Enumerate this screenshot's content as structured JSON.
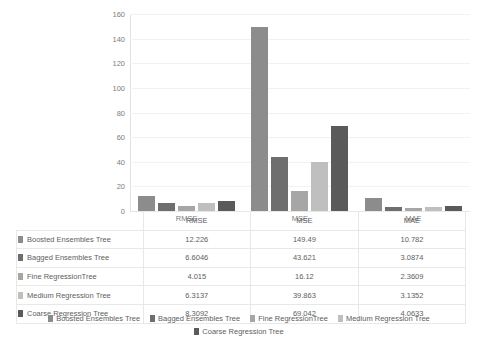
{
  "chart_data": {
    "type": "bar",
    "title": "",
    "xlabel": "",
    "ylabel": "",
    "categories": [
      "RMSE",
      "MSE",
      "MAE"
    ],
    "ylim": [
      0,
      160
    ],
    "yticks": [
      0,
      20,
      40,
      60,
      80,
      100,
      120,
      140,
      160
    ],
    "grid": true,
    "legend_position": "bottom",
    "series": [
      {
        "name": "Boosted Ensembles Tree",
        "color": "#8c8c8c",
        "values": [
          12.226,
          149.49,
          10.782
        ],
        "labels": [
          "12.226",
          "149.49",
          "10.782"
        ]
      },
      {
        "name": "Bagged Ensembles Tree",
        "color": "#6e6e6e",
        "values": [
          6.6046,
          43.621,
          3.0874
        ],
        "labels": [
          "6.6046",
          "43.621",
          "3.0874"
        ]
      },
      {
        "name": "Fine RegressionTree",
        "color": "#a6a6a6",
        "values": [
          4.015,
          16.12,
          2.3609
        ],
        "labels": [
          "4.015",
          "16.12",
          "2.3609"
        ]
      },
      {
        "name": "Medium Regression Tree",
        "color": "#bfbfbf",
        "values": [
          6.3137,
          39.863,
          3.1352
        ],
        "labels": [
          "6.3137",
          "39.863",
          "3.1352"
        ]
      },
      {
        "name": "Coarse Regression Tree",
        "color": "#5a5a5a",
        "values": [
          8.3092,
          69.042,
          4.0633
        ],
        "labels": [
          "8.3092",
          "69.042",
          "4.0633"
        ]
      }
    ]
  },
  "table": {
    "corner": "",
    "columns": [
      "RMSE",
      "MSE",
      "MAE"
    ],
    "rows": [
      {
        "label": "Boosted Ensembles Tree",
        "color": "#8c8c8c",
        "values": [
          "12.226",
          "149.49",
          "10.782"
        ]
      },
      {
        "label": "Bagged Ensembles Tree",
        "color": "#6e6e6e",
        "values": [
          "6.6046",
          "43.621",
          "3.0874"
        ]
      },
      {
        "label": "Fine RegressionTree",
        "color": "#a6a6a6",
        "values": [
          "4.015",
          "16.12",
          "2.3609"
        ]
      },
      {
        "label": "Medium Regression Tree",
        "color": "#bfbfbf",
        "values": [
          "6.3137",
          "39.863",
          "3.1352"
        ]
      },
      {
        "label": "Coarse Regression Tree",
        "color": "#5a5a5a",
        "values": [
          "8.3092",
          "69.042",
          "4.0633"
        ]
      }
    ]
  },
  "legend": {
    "items": [
      {
        "label": "Boosted Ensembles Tree",
        "color": "#8c8c8c"
      },
      {
        "label": "Bagged Ensembles Tree",
        "color": "#6e6e6e"
      },
      {
        "label": "Fine RegressionTree",
        "color": "#a6a6a6"
      },
      {
        "label": "Medium Regression Tree",
        "color": "#bfbfbf"
      },
      {
        "label": "Coarse Regression Tree",
        "color": "#5a5a5a"
      }
    ]
  },
  "axis": {
    "y_ticks": [
      "0",
      "20",
      "40",
      "60",
      "80",
      "100",
      "120",
      "140",
      "160"
    ]
  }
}
